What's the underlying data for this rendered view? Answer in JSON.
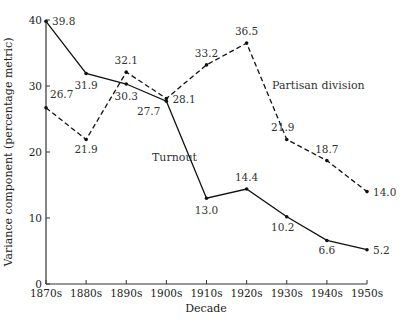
{
  "chart_data": {
    "type": "line",
    "title": "",
    "xlabel": "Decade",
    "ylabel": "Variance component (percentage metric)",
    "ylim": [
      0,
      40
    ],
    "yticks": [
      0,
      10,
      20,
      30,
      40
    ],
    "grid": false,
    "categories": [
      "1870s",
      "1880s",
      "1890s",
      "1900s",
      "1910s",
      "1920s",
      "1930s",
      "1940s",
      "1950s"
    ],
    "series": [
      {
        "name": "Turnout",
        "style": "solid",
        "values": [
          39.8,
          31.9,
          30.3,
          27.7,
          13.0,
          14.4,
          10.2,
          6.6,
          5.2
        ],
        "labels": [
          "39.8",
          "31.9",
          "30.3",
          "27.7",
          "13.0",
          "14.4",
          "10.2",
          "6.6",
          "5.2"
        ]
      },
      {
        "name": "Partisan division",
        "style": "dashed",
        "values": [
          26.7,
          21.9,
          32.1,
          28.1,
          33.2,
          36.5,
          21.9,
          18.7,
          14.0
        ],
        "labels": [
          "26.7",
          "21.9",
          "32.1",
          "28.1",
          "33.2",
          "36.5",
          "21.9",
          "18.7",
          "14.0"
        ]
      }
    ],
    "annotations": [
      {
        "text": "Turnout",
        "series": "Turnout"
      },
      {
        "text": "Partisan division",
        "series": "Partisan division"
      }
    ]
  }
}
